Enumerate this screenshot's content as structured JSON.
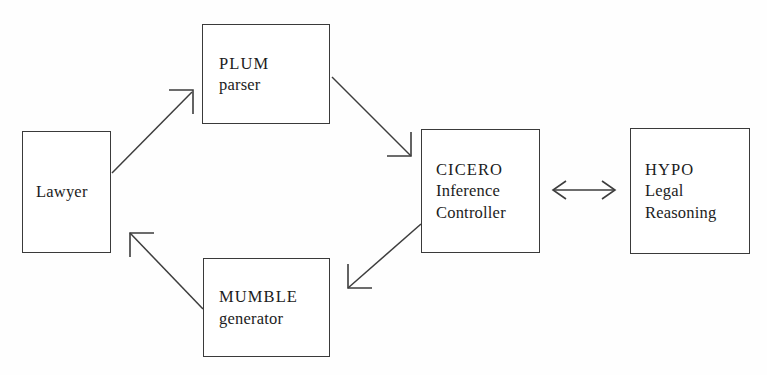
{
  "diagram": {
    "background_color": "#fefefe",
    "stroke_color": "#3d3d3d",
    "text_color": "#1c1c1c",
    "nodes": [
      {
        "id": "lawyer",
        "lines": [
          "Lawyer"
        ],
        "x": 22,
        "y": 131,
        "w": 89,
        "h": 122
      },
      {
        "id": "plum",
        "lines": [
          "PLUM",
          "parser"
        ],
        "x": 202,
        "y": 24,
        "w": 128,
        "h": 100
      },
      {
        "id": "cicero",
        "lines": [
          "CICERO",
          "Inference",
          "Controller"
        ],
        "x": 421,
        "y": 129,
        "w": 119,
        "h": 124
      },
      {
        "id": "hypo",
        "lines": [
          "HYPO",
          "Legal",
          "Reasoning"
        ],
        "x": 630,
        "y": 128,
        "w": 120,
        "h": 126
      },
      {
        "id": "mumble",
        "lines": [
          "MUMBLE",
          "generator"
        ],
        "x": 203,
        "y": 258,
        "w": 127,
        "h": 99
      }
    ],
    "edges": [
      {
        "id": "lawyer-to-plum",
        "from": "lawyer",
        "to": "plum",
        "direction": "one-way"
      },
      {
        "id": "plum-to-cicero",
        "from": "plum",
        "to": "cicero",
        "direction": "one-way"
      },
      {
        "id": "cicero-to-mumble",
        "from": "cicero",
        "to": "mumble",
        "direction": "one-way"
      },
      {
        "id": "mumble-to-lawyer",
        "from": "mumble",
        "to": "lawyer",
        "direction": "one-way"
      },
      {
        "id": "cicero-hypo",
        "from": "cicero",
        "to": "hypo",
        "direction": "bidirectional"
      }
    ]
  }
}
